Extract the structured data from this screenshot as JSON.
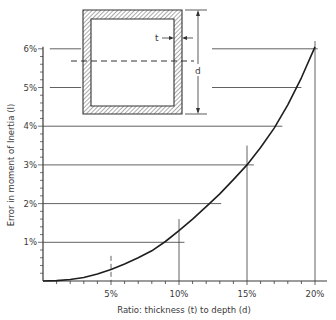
{
  "chart_data": {
    "type": "line",
    "title": "",
    "xlabel": "Ratio: thickness (t) to depth (d)",
    "ylabel": "Error in moment of Inertia (I)",
    "xlim": [
      0,
      20
    ],
    "ylim": [
      0,
      6
    ],
    "x_ticks": [
      "5%",
      "10%",
      "15%",
      "20%"
    ],
    "x_tick_values": [
      5,
      10,
      15,
      20
    ],
    "y_ticks": [
      "1%",
      "2%",
      "3%",
      "4%",
      "5%",
      "6%"
    ],
    "y_tick_values": [
      1,
      2,
      3,
      4,
      5,
      6
    ],
    "grid": false,
    "series": [
      {
        "name": "Error in I vs t/d",
        "x": [
          0,
          1,
          2,
          3,
          4,
          5,
          6,
          7,
          8,
          9,
          10,
          11,
          12,
          13,
          14,
          15,
          16,
          17,
          18,
          19,
          20
        ],
        "y": [
          0,
          0.01,
          0.04,
          0.09,
          0.18,
          0.3,
          0.44,
          0.6,
          0.78,
          1.02,
          1.3,
          1.6,
          1.92,
          2.25,
          2.62,
          3.0,
          3.45,
          3.95,
          4.55,
          5.25,
          6.05
        ]
      }
    ],
    "reference_lines": {
      "horizontal": [
        {
          "y": 1,
          "x_end": 10.4
        },
        {
          "y": 2,
          "x_end": 13.1
        },
        {
          "y": 3,
          "x_end": 15.5
        },
        {
          "y": 4,
          "x_end": 17.6
        },
        {
          "y": 5,
          "x_end": 19.0,
          "x_start_gap": true
        },
        {
          "y": 6,
          "x_end": 20.2,
          "x_start_gap": true
        }
      ],
      "vertical": [
        {
          "x": 5,
          "y_top": 0.65,
          "dashed": true
        },
        {
          "x": 10,
          "y_top": 1.6
        },
        {
          "x": 15,
          "y_top": 3.5
        },
        {
          "x": 20,
          "y_top": 6.2
        }
      ]
    },
    "inset_diagram": {
      "description": "Hollow rectangular section with wall thickness t and depth d; dashed neutral axis",
      "labels": [
        "t",
        "d"
      ]
    }
  }
}
